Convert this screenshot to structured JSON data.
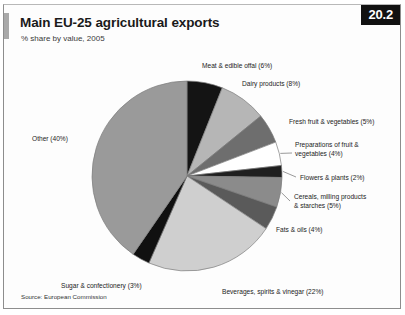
{
  "header": {
    "title": "Main EU-25 agricultural exports",
    "subtitle": "% share by value, 2005",
    "badge": "20.2"
  },
  "footer": {
    "source": "Source: European Commission"
  },
  "chart_data": {
    "type": "pie",
    "title": "Main EU-25 agricultural exports",
    "subtitle": "% share by value, 2005",
    "unit": "% share by value",
    "year": 2005,
    "xlabel": "",
    "ylabel": "",
    "legend_position": "callout-labels",
    "grid": false,
    "start_angle_deg": 0,
    "direction": "clockwise",
    "categories": [
      "Meat & edible offal",
      "Dairy products",
      "Fresh fruit & vegetables",
      "Preparations of fruit & vegetables",
      "Flowers & plants",
      "Cereals, milling products & starches",
      "Fats & oils",
      "Beverages, spirits & vinegar",
      "Sugar & confectionery",
      "Other"
    ],
    "values": [
      6,
      8,
      5,
      4,
      2,
      5,
      4,
      22,
      3,
      40
    ],
    "colors": [
      "#141414",
      "#b6b6b6",
      "#6e6e6e",
      "#ffffff",
      "#1f1f1f",
      "#8b8b8b",
      "#5a5a5a",
      "#cfcfcf",
      "#101010",
      "#9a9a9a"
    ],
    "slices": [
      {
        "label": "Meat & edible offal (6%)",
        "name": "Meat & edible offal",
        "value": 6,
        "color": "#141414"
      },
      {
        "label": "Dairy products (8%)",
        "name": "Dairy products",
        "value": 8,
        "color": "#b6b6b6"
      },
      {
        "label": "Fresh fruit & vegetables (5%)",
        "name": "Fresh fruit & vegetables",
        "value": 5,
        "color": "#6e6e6e"
      },
      {
        "label": "Preparations of fruit &\nvegetables (4%)",
        "name": "Preparations of fruit & vegetables",
        "value": 4,
        "color": "#ffffff"
      },
      {
        "label": "Flowers & plants (2%)",
        "name": "Flowers & plants",
        "value": 2,
        "color": "#1f1f1f"
      },
      {
        "label": "Cereals, milling products\n& starches (5%)",
        "name": "Cereals, milling products & starches",
        "value": 5,
        "color": "#8b8b8b"
      },
      {
        "label": "Fats & oils (4%)",
        "name": "Fats & oils",
        "value": 4,
        "color": "#5a5a5a"
      },
      {
        "label": "Beverages, spirits & vinegar (22%)",
        "name": "Beverages, spirits & vinegar",
        "value": 22,
        "color": "#cfcfcf"
      },
      {
        "label": "Sugar & confectionery (3%)",
        "name": "Sugar & confectionery",
        "value": 3,
        "color": "#101010"
      },
      {
        "label": "Other (40%)",
        "name": "Other",
        "value": 40,
        "color": "#9a9a9a"
      }
    ],
    "total": 100
  }
}
